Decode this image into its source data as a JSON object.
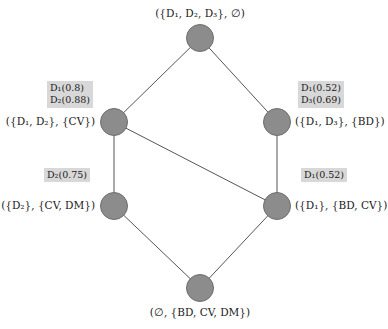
{
  "figure": {
    "type": "lattice-diagram",
    "title": "",
    "node_color": "#8c8c8c",
    "edge_color": "#555555",
    "annotation_bg": "#d8d8d8",
    "background": "#ffffff"
  },
  "nodes": [
    {
      "id": "top",
      "name": "node-top",
      "cx": 200,
      "cy": 38,
      "label": "({D₁, D₂, D₃}, ∅)",
      "label_pos": "above",
      "annotation": null
    },
    {
      "id": "left-upper",
      "name": "node-left-upper",
      "cx": 114,
      "cy": 122,
      "label": "({D₁, D₂}, {CV})",
      "label_pos": "left",
      "annotation": [
        "D₁(0.8)",
        "D₂(0.88)"
      ]
    },
    {
      "id": "right-upper",
      "name": "node-right-upper",
      "cx": 277,
      "cy": 122,
      "label": "({D₁, D₃}, {BD})",
      "label_pos": "right",
      "annotation": [
        "D₁(0.52)",
        "D₃(0.69)"
      ]
    },
    {
      "id": "left-lower",
      "name": "node-left-lower",
      "cx": 114,
      "cy": 206,
      "label": "({D₂}, {CV, DM})",
      "label_pos": "left",
      "annotation": [
        "D₂(0.75)"
      ]
    },
    {
      "id": "right-lower",
      "name": "node-right-lower",
      "cx": 277,
      "cy": 206,
      "label": "({D₁}, {BD, CV})",
      "label_pos": "right",
      "annotation": [
        "D₁(0.52)"
      ]
    },
    {
      "id": "bottom",
      "name": "node-bottom",
      "cx": 200,
      "cy": 288,
      "label": "(∅, {BD, CV, DM})",
      "label_pos": "below",
      "annotation": null
    }
  ],
  "edges": [
    {
      "from": "top",
      "to": "left-upper"
    },
    {
      "from": "top",
      "to": "right-upper"
    },
    {
      "from": "left-upper",
      "to": "left-lower"
    },
    {
      "from": "left-upper",
      "to": "right-lower"
    },
    {
      "from": "right-upper",
      "to": "right-lower"
    },
    {
      "from": "left-lower",
      "to": "bottom"
    },
    {
      "from": "right-lower",
      "to": "bottom"
    }
  ],
  "labels": {
    "top": "({D₁, D₂, D₃}, ∅)",
    "left_upper": "({D₁, D₂}, {CV})",
    "right_upper": "({D₁, D₃}, {BD})",
    "left_lower": "({D₂}, {CV, DM})",
    "right_lower": "({D₁}, {BD, CV})",
    "bottom": "(∅, {BD, CV, DM})"
  },
  "annotations": {
    "left_upper_1": "D₁(0.8)",
    "left_upper_2": "D₂(0.88)",
    "right_upper_1": "D₁(0.52)",
    "right_upper_2": "D₃(0.69)",
    "left_lower_1": "D₂(0.75)",
    "right_lower_1": "D₁(0.52)"
  }
}
